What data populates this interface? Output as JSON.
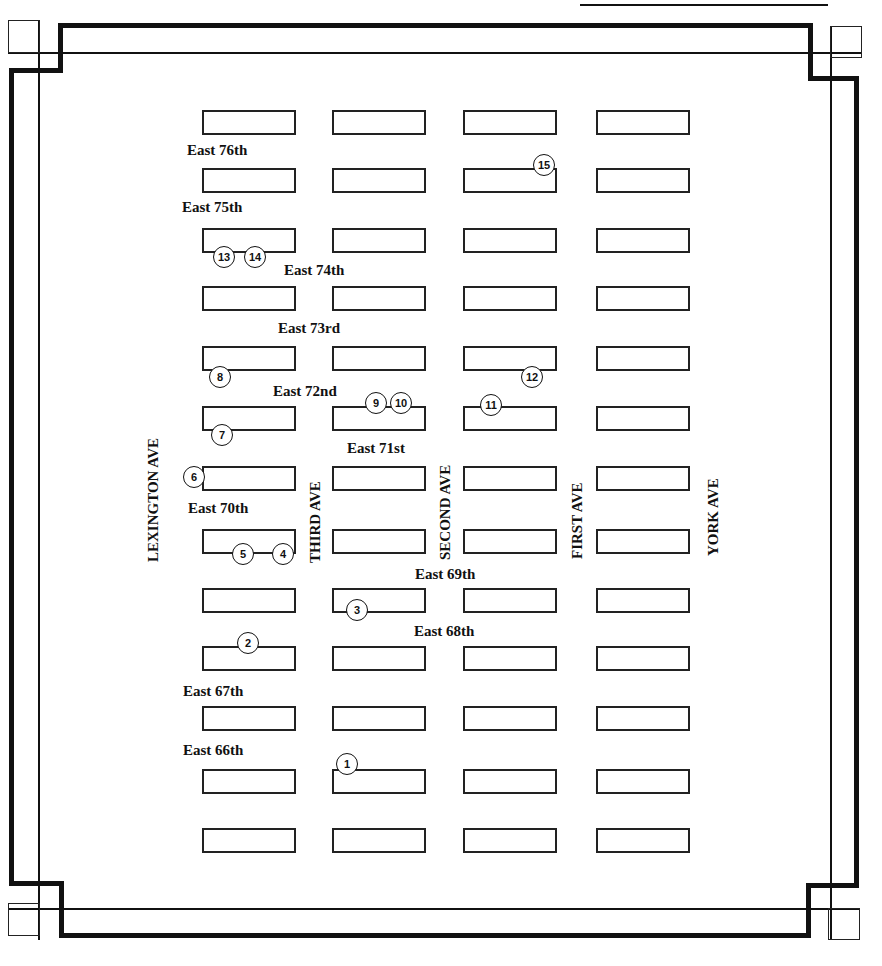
{
  "map": {
    "colors": {
      "ink": "#111111",
      "background": "#ffffff"
    },
    "avenues": [
      {
        "id": "lexington",
        "label": "LEXINGTON AVE",
        "x": 146,
        "y": 562
      },
      {
        "id": "third",
        "label": "THIRD AVE",
        "x": 308,
        "y": 563
      },
      {
        "id": "second",
        "label": "SECOND AVE",
        "x": 438,
        "y": 560
      },
      {
        "id": "first",
        "label": "FIRST AVE",
        "x": 570,
        "y": 559
      },
      {
        "id": "york",
        "label": "YORK AVE",
        "x": 706,
        "y": 556
      }
    ],
    "streets": [
      {
        "id": "e76",
        "label": "East 76th",
        "x": 187,
        "y": 143
      },
      {
        "id": "e75",
        "label": "East 75th",
        "x": 182,
        "y": 200
      },
      {
        "id": "e74",
        "label": "East 74th",
        "x": 284,
        "y": 263
      },
      {
        "id": "e73",
        "label": "East 73rd",
        "x": 278,
        "y": 321
      },
      {
        "id": "e72",
        "label": "East 72nd",
        "x": 273,
        "y": 384
      },
      {
        "id": "e71",
        "label": "East 71st",
        "x": 347,
        "y": 441
      },
      {
        "id": "e70",
        "label": "East 70th",
        "x": 188,
        "y": 501
      },
      {
        "id": "e69",
        "label": "East 69th",
        "x": 415,
        "y": 567
      },
      {
        "id": "e68",
        "label": "East 68th",
        "x": 414,
        "y": 624
      },
      {
        "id": "e67",
        "label": "East 67th",
        "x": 183,
        "y": 684
      },
      {
        "id": "e66",
        "label": "East 66th",
        "x": 183,
        "y": 743
      }
    ],
    "block_columns_x": [
      202,
      332,
      463,
      596
    ],
    "block_width": 94,
    "block_height": 25,
    "block_rows_y": [
      110,
      168,
      228,
      286,
      346,
      406,
      466,
      529,
      588,
      646,
      706,
      769,
      828
    ],
    "markers": [
      {
        "n": "1",
        "x": 336,
        "y": 753
      },
      {
        "n": "2",
        "x": 237,
        "y": 632
      },
      {
        "n": "3",
        "x": 346,
        "y": 599
      },
      {
        "n": "4",
        "x": 272,
        "y": 543
      },
      {
        "n": "5",
        "x": 232,
        "y": 543
      },
      {
        "n": "6",
        "x": 183,
        "y": 466
      },
      {
        "n": "7",
        "x": 211,
        "y": 424
      },
      {
        "n": "8",
        "x": 209,
        "y": 366
      },
      {
        "n": "9",
        "x": 365,
        "y": 392
      },
      {
        "n": "10",
        "x": 390,
        "y": 392
      },
      {
        "n": "11",
        "x": 480,
        "y": 394
      },
      {
        "n": "12",
        "x": 521,
        "y": 366
      },
      {
        "n": "13",
        "x": 213,
        "y": 246
      },
      {
        "n": "14",
        "x": 244,
        "y": 246
      },
      {
        "n": "15",
        "x": 533,
        "y": 154
      }
    ]
  }
}
